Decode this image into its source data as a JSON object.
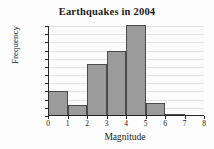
{
  "chart_data": {
    "type": "bar",
    "title": "Earthquakes in 2004",
    "xlabel": "Magnitude",
    "ylabel": "Frequency",
    "categories": [
      "0-1",
      "1-2",
      "2-3",
      "3-4",
      "4-5",
      "5-6",
      "6-7",
      "7-8"
    ],
    "bin_edges": [
      0,
      1,
      2,
      3,
      4,
      5,
      6,
      7,
      8
    ],
    "values": [
      3100,
      1300,
      6400,
      8000,
      11100,
      1600,
      300,
      0
    ],
    "xlim": [
      0,
      8
    ],
    "ylim": [
      0,
      11000
    ],
    "xticks": [
      "0",
      "1",
      "2",
      "3",
      "4",
      "5",
      "6",
      "7",
      "8"
    ],
    "yticks": [
      "0",
      "1,000",
      "2,000",
      "3,000",
      "4,000",
      "5,000",
      "6,000",
      "7,000",
      "8,000",
      "9,000",
      "10,000",
      "11,000"
    ],
    "ytick_values": [
      0,
      1000,
      2000,
      3000,
      4000,
      5000,
      6000,
      7000,
      8000,
      9000,
      10000,
      11000
    ],
    "grid": true,
    "legend": false,
    "bar_color": "#9b9b9b",
    "bar_edge_color": "#4a4a4a",
    "grid_color": "#e2e2e2",
    "axis_color": "#262626",
    "background_color": "#fbfbfb"
  }
}
